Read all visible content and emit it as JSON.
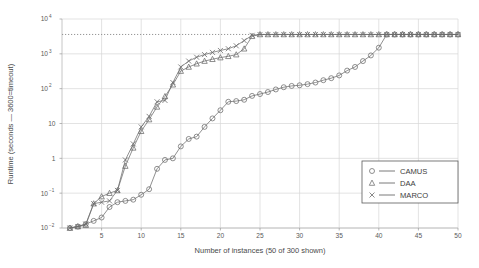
{
  "chart_data": {
    "type": "line",
    "title": "",
    "xlabel": "Number of instances (50 of 300 shown)",
    "ylabel": "Runtime (seconds — 3600=timeout)",
    "xlim": [
      0,
      50
    ],
    "ylim": [
      0.01,
      10000
    ],
    "yscale": "log",
    "grid": true,
    "legend_position": "bottom-right",
    "xticks": [
      5,
      10,
      15,
      20,
      25,
      30,
      35,
      40,
      45,
      50
    ],
    "xtick_labels": [
      "5",
      "10",
      "15",
      "20",
      "25",
      "30",
      "35",
      "40",
      "45",
      "50"
    ],
    "yticks": [
      0.01,
      0.1,
      1,
      10,
      100,
      1000,
      10000
    ],
    "ytick_labels": [
      "10⁻²",
      "10⁻¹",
      "1",
      "10",
      "10²",
      "10³",
      "10⁴"
    ],
    "annotations": [
      {
        "name": "timeout-line",
        "type": "hline",
        "value": 3600,
        "label": "3600 = timeout",
        "style": "dotted"
      }
    ],
    "series": [
      {
        "name": "CAMUS",
        "marker": "circle",
        "color": "#6b6b6b",
        "x": [
          1,
          2,
          3,
          4,
          5,
          6,
          7,
          8,
          9,
          10,
          11,
          12,
          13,
          14,
          15,
          16,
          17,
          18,
          19,
          20,
          21,
          22,
          23,
          24,
          25,
          26,
          27,
          28,
          29,
          30,
          31,
          32,
          33,
          34,
          35,
          36,
          37,
          38,
          39,
          40,
          41,
          42,
          43,
          44,
          45,
          46,
          47,
          48,
          49,
          50
        ],
        "values": [
          0.01,
          0.011,
          0.013,
          0.016,
          0.02,
          0.04,
          0.055,
          0.06,
          0.065,
          0.09,
          0.13,
          0.5,
          0.9,
          1.0,
          2.2,
          3.6,
          4.2,
          8.0,
          14,
          24,
          42,
          44,
          48,
          62,
          70,
          80,
          95,
          110,
          120,
          125,
          135,
          150,
          175,
          200,
          240,
          330,
          420,
          620,
          900,
          1500,
          3600,
          3600,
          3600,
          3600,
          3600,
          3600,
          3600,
          3600,
          3600,
          3600
        ]
      },
      {
        "name": "DAA",
        "marker": "triangle",
        "color": "#6b6b6b",
        "x": [
          1,
          2,
          3,
          4,
          5,
          6,
          7,
          8,
          9,
          10,
          11,
          12,
          13,
          14,
          15,
          16,
          17,
          18,
          19,
          20,
          21,
          22,
          23,
          24,
          25,
          26,
          27,
          28,
          29,
          30,
          31,
          32,
          33,
          34,
          35,
          36,
          37,
          38,
          39,
          40,
          41,
          42,
          43,
          44,
          45,
          46,
          47,
          48,
          49,
          50
        ],
        "values": [
          0.01,
          0.011,
          0.012,
          0.05,
          0.08,
          0.1,
          0.12,
          0.6,
          2.0,
          6.0,
          13,
          30,
          60,
          130,
          320,
          420,
          520,
          620,
          700,
          780,
          850,
          950,
          1400,
          3200,
          3600,
          3600,
          3600,
          3600,
          3600,
          3600,
          3600,
          3600,
          3600,
          3600,
          3600,
          3600,
          3600,
          3600,
          3600,
          3600,
          3600,
          3600,
          3600,
          3600,
          3600,
          3600,
          3600,
          3600,
          3600,
          3600
        ]
      },
      {
        "name": "MARCO",
        "marker": "cross",
        "color": "#6b6b6b",
        "x": [
          1,
          2,
          3,
          4,
          5,
          6,
          7,
          8,
          9,
          10,
          11,
          12,
          13,
          14,
          15,
          16,
          17,
          18,
          19,
          20,
          21,
          22,
          23,
          24,
          25,
          26,
          27,
          28,
          29,
          30,
          31,
          32,
          33,
          34,
          35,
          36,
          37,
          38,
          39,
          40,
          41,
          42,
          43,
          44,
          45,
          46,
          47,
          48,
          49,
          50
        ],
        "values": [
          0.01,
          0.011,
          0.013,
          0.05,
          0.055,
          0.06,
          0.12,
          0.9,
          2.6,
          8.0,
          16,
          42,
          46,
          150,
          420,
          620,
          800,
          950,
          1100,
          1250,
          1400,
          1700,
          2400,
          3400,
          3600,
          3600,
          3600,
          3600,
          3600,
          3600,
          3600,
          3600,
          3600,
          3600,
          3600,
          3600,
          3600,
          3600,
          3600,
          3600,
          3600,
          3600,
          3600,
          3600,
          3600,
          3600,
          3600,
          3600,
          3600,
          3600
        ]
      }
    ]
  },
  "legend": {
    "entries": [
      {
        "label": "CAMUS",
        "marker": "circle"
      },
      {
        "label": "DAA",
        "marker": "triangle"
      },
      {
        "label": "MARCO",
        "marker": "cross"
      }
    ]
  },
  "colors": {
    "background": "#ffffff",
    "grid": "#d7d7d7",
    "line": "#6b6b6b",
    "text": "#4a4a4a",
    "legend_border": "#5a5a5a"
  }
}
